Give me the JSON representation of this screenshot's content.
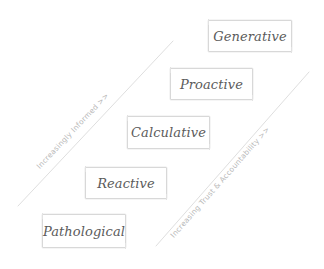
{
  "diagram": {
    "style": "hand-drawn sketch",
    "background_color": "#ffffff",
    "box_border_color": "#d8d8d8",
    "box_text_color": "#5b5b5b",
    "axis_line_color": "#dadada",
    "axis_text_color": "#b9b9b9",
    "levels": [
      {
        "label": "Generative",
        "rank": 5
      },
      {
        "label": "Proactive",
        "rank": 4
      },
      {
        "label": "Calculative",
        "rank": 3
      },
      {
        "label": "Reactive",
        "rank": 2
      },
      {
        "label": "Pathological",
        "rank": 1
      }
    ],
    "axes": [
      {
        "label": "Increasingly Informed >>",
        "position": "left"
      },
      {
        "label": "Increasing Trust & Accountability >>",
        "position": "right"
      }
    ]
  }
}
